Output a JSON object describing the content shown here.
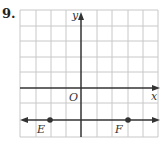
{
  "problem": {
    "number": "9."
  },
  "graph": {
    "x_axis_label": "x",
    "y_axis_label": "y",
    "origin_label": "O",
    "grid": true,
    "grid_color": "#c8c8c8",
    "line_color": "#333333",
    "points": [
      {
        "label": "E",
        "x": -3,
        "y": -2
      },
      {
        "label": "F",
        "x": 3,
        "y": -2
      }
    ],
    "line": {
      "through": [
        "E",
        "F"
      ],
      "equation": "y = -2"
    }
  }
}
